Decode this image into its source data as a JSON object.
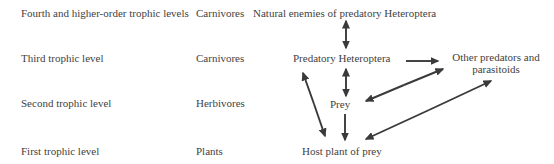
{
  "diagram": {
    "title_implicit": "",
    "colors": {
      "background": "#ffffff",
      "text": "#3f3f3f",
      "arrow": "#3a3a3a"
    },
    "rows": [
      {
        "level": "Fourth and higher-order trophic levels",
        "category": "Carnivores"
      },
      {
        "level": "Third trophic level",
        "category": "Carnivores"
      },
      {
        "level": "Second trophic level",
        "category": "Herbivores"
      },
      {
        "level": "First trophic level",
        "category": "Plants"
      }
    ],
    "nodes": {
      "natural_enemies": "Natural enemies of predatory Heteroptera",
      "predatory_heteroptera": "Predatory Heteroptera",
      "other_predators": "Other predators and parasitoids",
      "prey": "Prey",
      "host_plant": "Host plant of prey"
    },
    "edges": [
      {
        "from": "natural_enemies",
        "to": "predatory_heteroptera",
        "bidirectional": true
      },
      {
        "from": "predatory_heteroptera",
        "to": "other_predators",
        "bidirectional": false
      },
      {
        "from": "predatory_heteroptera",
        "to": "prey",
        "bidirectional": true
      },
      {
        "from": "predatory_heteroptera",
        "to": "host_plant",
        "bidirectional": true
      },
      {
        "from": "prey",
        "to": "other_predators",
        "bidirectional": true
      },
      {
        "from": "prey",
        "to": "host_plant",
        "bidirectional": false
      },
      {
        "from": "host_plant",
        "to": "other_predators",
        "bidirectional": true
      }
    ]
  }
}
